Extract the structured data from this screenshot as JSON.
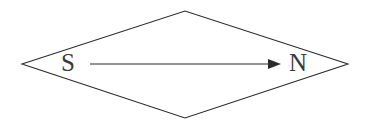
{
  "canvas": {
    "width": 375,
    "height": 125,
    "background_color": "#ffffff"
  },
  "diagram": {
    "type": "magnetic-dipole-rhombus",
    "stroke_color": "#2b2b2b",
    "label_color": "#3a3a3a",
    "shape": {
      "name": "rhombus",
      "points": "22,64 185,11 348,64 185,118"
    },
    "labels": {
      "south_pole": "S",
      "north_pole": "N"
    },
    "label_positions": {
      "south_x": 68,
      "south_y": 64,
      "north_x": 298,
      "north_y": 64
    },
    "arrow": {
      "x1": 90,
      "y1": 64,
      "x2": 271,
      "y2": 64,
      "head_points": "281,64 268,59 268,69"
    }
  }
}
